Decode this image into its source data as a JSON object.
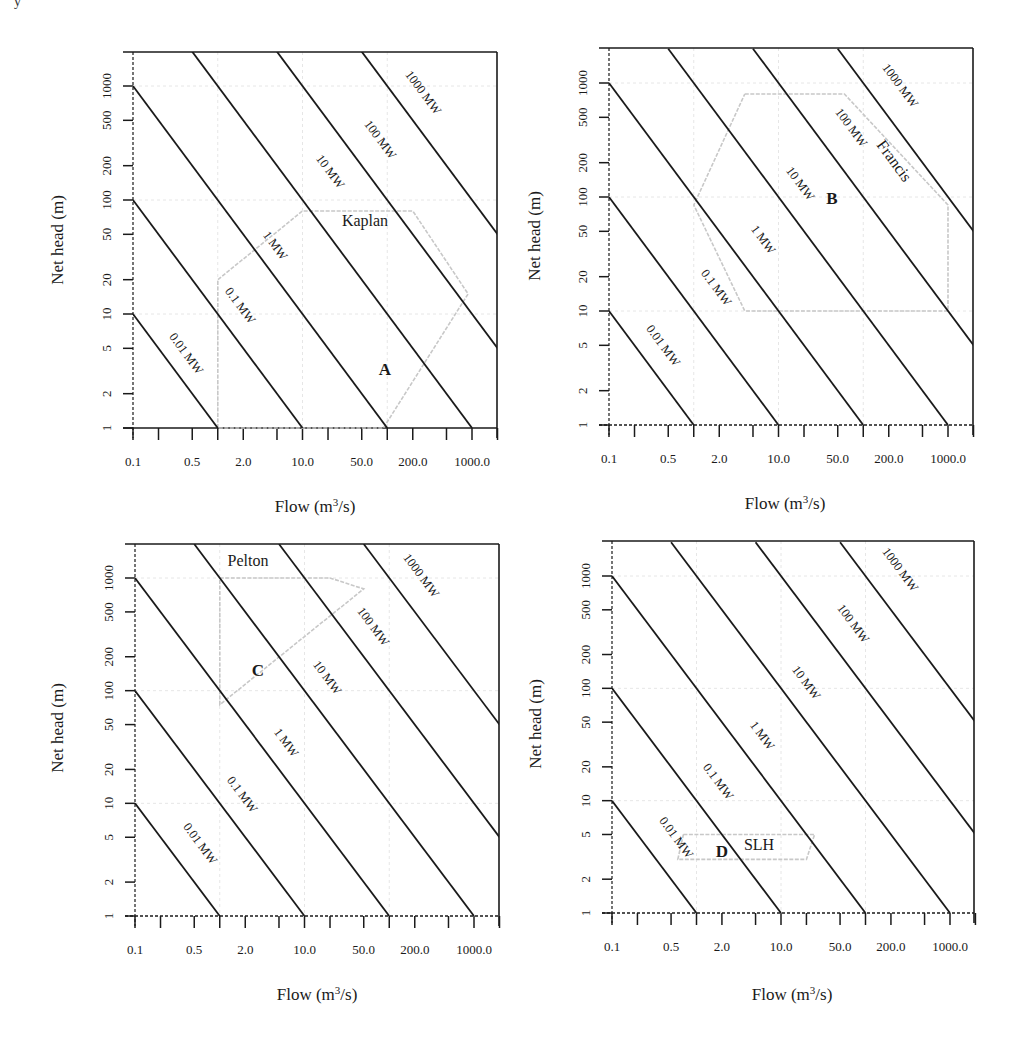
{
  "figure": {
    "corner_mark": "y",
    "shared": {
      "x_axis_title": "Flow (m³/s)",
      "y_axis_title": "Net head (m)",
      "x_tick_labels": [
        "0.1",
        "0.5",
        "2.0",
        "10.0",
        "50.0",
        "200.0",
        "1000.0"
      ],
      "y_tick_labels": [
        "1",
        "2",
        "5",
        "10",
        "20",
        "50",
        "100",
        "200",
        "500",
        "1000"
      ],
      "power_lines": [
        "0.01 MW",
        "0.1 MW",
        "1 MW",
        "10 MW",
        "100 MW",
        "1000 MW"
      ],
      "colors": {
        "line": "#1a1a1a",
        "region": "#c8c8c8",
        "grid": "#e6e6e6"
      }
    }
  },
  "chart_data": [
    {
      "type": "line",
      "panel": "A",
      "title": "",
      "region_name": "Kaplan",
      "region_letter": "A",
      "xlabel": "Flow (m³/s)",
      "ylabel": "Net head (m)",
      "xscale": "log",
      "yscale": "log",
      "xlim": [
        0.1,
        2000
      ],
      "ylim": [
        1,
        2000
      ],
      "x_ticks": [
        0.1,
        0.2,
        0.5,
        1,
        2,
        5,
        10,
        20,
        50,
        100,
        200,
        500,
        1000,
        2000
      ],
      "x_tick_labels": [
        "0.1",
        "0.5",
        "2.0",
        "10.0",
        "50.0",
        "200.0",
        "1000.0"
      ],
      "y_ticks": [
        1,
        2,
        5,
        10,
        20,
        50,
        100,
        200,
        500,
        1000
      ],
      "series": [
        {
          "name": "0.01 MW",
          "x": [
            0.1,
            1
          ],
          "y": [
            10,
            1
          ]
        },
        {
          "name": "0.1 MW",
          "x": [
            0.1,
            10
          ],
          "y": [
            100,
            1
          ]
        },
        {
          "name": "1 MW",
          "x": [
            0.1,
            100
          ],
          "y": [
            1000,
            1
          ]
        },
        {
          "name": "10 MW",
          "x": [
            0.5,
            1000
          ],
          "y": [
            2000,
            1
          ]
        },
        {
          "name": "100 MW",
          "x": [
            5,
            2000
          ],
          "y": [
            2000,
            5
          ]
        },
        {
          "name": "1000 MW",
          "x": [
            50,
            2000
          ],
          "y": [
            2000,
            50
          ]
        }
      ],
      "region_polygon": {
        "x": [
          1,
          1,
          10,
          200,
          900,
          90,
          1
        ],
        "y": [
          1,
          20,
          80,
          80,
          15,
          1,
          1
        ]
      },
      "px": {
        "x0": 133,
        "x1000": 472,
        "right": 497,
        "y1": 428,
        "y1000": 86,
        "top": 52
      },
      "labels_pos": {
        "name": [
          365,
          226
        ],
        "letter": [
          385,
          375
        ],
        "mw": [
          [
            183,
            356
          ],
          [
            237,
            308
          ],
          [
            272,
            248
          ],
          [
            327,
            174
          ],
          [
            377,
            142
          ],
          [
            420,
            95
          ]
        ]
      },
      "axis_title_pos": {
        "x": [
          315,
          512
        ],
        "y": [
          63,
          240
        ]
      }
    },
    {
      "type": "line",
      "panel": "B",
      "title": "",
      "region_name": "Francis",
      "region_letter": "B",
      "xlabel": "Flow (m³/s)",
      "ylabel": "Net head (m)",
      "xscale": "log",
      "yscale": "log",
      "xlim": [
        0.1,
        2000
      ],
      "ylim": [
        1,
        2000
      ],
      "x_ticks": [
        0.1,
        0.2,
        0.5,
        1,
        2,
        5,
        10,
        20,
        50,
        100,
        200,
        500,
        1000,
        2000
      ],
      "x_tick_labels": [
        "0.1",
        "0.5",
        "2.0",
        "10.0",
        "50.0",
        "200.0",
        "1000.0"
      ],
      "y_ticks": [
        1,
        2,
        5,
        10,
        20,
        50,
        100,
        200,
        500,
        1000
      ],
      "series": [
        {
          "name": "0.01 MW",
          "x": [
            0.1,
            1
          ],
          "y": [
            10,
            1
          ]
        },
        {
          "name": "0.1 MW",
          "x": [
            0.1,
            10
          ],
          "y": [
            100,
            1
          ]
        },
        {
          "name": "1 MW",
          "x": [
            0.1,
            100
          ],
          "y": [
            1000,
            1
          ]
        },
        {
          "name": "10 MW",
          "x": [
            0.5,
            1000
          ],
          "y": [
            2000,
            1
          ]
        },
        {
          "name": "100 MW",
          "x": [
            5,
            2000
          ],
          "y": [
            2000,
            5
          ]
        },
        {
          "name": "1000 MW",
          "x": [
            50,
            2000
          ],
          "y": [
            2000,
            50
          ]
        }
      ],
      "region_polygon": {
        "x": [
          4,
          60,
          1000,
          1000,
          4,
          1,
          4
        ],
        "y": [
          800,
          800,
          85,
          10,
          10,
          85,
          800
        ]
      },
      "px": {
        "x0": 609,
        "x1000": 948,
        "right": 973,
        "y1": 425,
        "y1000": 83,
        "top": 48
      },
      "labels_pos": {
        "name": [
          890,
          164
        ],
        "letter": [
          832,
          204
        ],
        "mw": [
          [
            660,
            348
          ],
          [
            713,
            290
          ],
          [
            760,
            242
          ],
          [
            797,
            186
          ],
          [
            848,
            130
          ],
          [
            897,
            88
          ]
        ]
      },
      "axis_title_pos": {
        "x": [
          785,
          509
        ],
        "y": [
          540,
          236
        ]
      }
    },
    {
      "type": "line",
      "panel": "C",
      "title": "",
      "region_name": "Pelton",
      "region_letter": "C",
      "xlabel": "Flow (m³/s)",
      "ylabel": "Net head (m)",
      "xscale": "log",
      "yscale": "log",
      "xlim": [
        0.1,
        2000
      ],
      "ylim": [
        1,
        2000
      ],
      "x_ticks": [
        0.1,
        0.2,
        0.5,
        1,
        2,
        5,
        10,
        20,
        50,
        100,
        200,
        500,
        1000,
        2000
      ],
      "x_tick_labels": [
        "0.1",
        "0.5",
        "2.0",
        "10.0",
        "50.0",
        "200.0",
        "1000.0"
      ],
      "y_ticks": [
        1,
        2,
        5,
        10,
        20,
        50,
        100,
        200,
        500,
        1000
      ],
      "series": [
        {
          "name": "0.01 MW",
          "x": [
            0.1,
            1
          ],
          "y": [
            10,
            1
          ]
        },
        {
          "name": "0.1 MW",
          "x": [
            0.1,
            10
          ],
          "y": [
            100,
            1
          ]
        },
        {
          "name": "1 MW",
          "x": [
            0.1,
            100
          ],
          "y": [
            1000,
            1
          ]
        },
        {
          "name": "10 MW",
          "x": [
            0.5,
            1000
          ],
          "y": [
            2000,
            1
          ]
        },
        {
          "name": "100 MW",
          "x": [
            5,
            2000
          ],
          "y": [
            2000,
            5
          ]
        },
        {
          "name": "1000 MW",
          "x": [
            50,
            2000
          ],
          "y": [
            2000,
            50
          ]
        }
      ],
      "region_polygon": {
        "x": [
          1,
          20,
          50,
          1,
          1
        ],
        "y": [
          1000,
          1000,
          800,
          75,
          1000
        ]
      },
      "px": {
        "x0": 135,
        "x1000": 474,
        "right": 499,
        "y1": 916,
        "y1000": 578,
        "top": 544
      },
      "labels_pos": {
        "name": [
          248,
          566
        ],
        "letter": [
          258,
          676
        ],
        "mw": [
          [
            197,
            846
          ],
          [
            239,
            797
          ],
          [
            283,
            745
          ],
          [
            324,
            680
          ],
          [
            370,
            629
          ],
          [
            418,
            578
          ]
        ]
      },
      "axis_title_pos": {
        "x": [
          317,
          1000
        ],
        "y": [
          63,
          728
        ]
      }
    },
    {
      "type": "line",
      "panel": "D",
      "title": "",
      "region_name": "SLH",
      "region_letter": "D",
      "xlabel": "Flow (m³/s)",
      "ylabel": "Net head (m)",
      "xscale": "log",
      "yscale": "log",
      "xlim": [
        0.1,
        2000
      ],
      "ylim": [
        1,
        2000
      ],
      "x_ticks": [
        0.1,
        0.2,
        0.5,
        1,
        2,
        5,
        10,
        20,
        50,
        100,
        200,
        500,
        1000,
        2000
      ],
      "x_tick_labels": [
        "0.1",
        "0.5",
        "2.0",
        "10.0",
        "50.0",
        "200.0",
        "1000.0"
      ],
      "y_ticks": [
        1,
        2,
        5,
        10,
        20,
        50,
        100,
        200,
        500,
        1000
      ],
      "series": [
        {
          "name": "0.01 MW",
          "x": [
            0.1,
            1
          ],
          "y": [
            10,
            1
          ]
        },
        {
          "name": "0.1 MW",
          "x": [
            0.1,
            10
          ],
          "y": [
            100,
            1
          ]
        },
        {
          "name": "1 MW",
          "x": [
            0.1,
            100
          ],
          "y": [
            1000,
            1
          ]
        },
        {
          "name": "10 MW",
          "x": [
            0.5,
            1000
          ],
          "y": [
            2000,
            1
          ]
        },
        {
          "name": "100 MW",
          "x": [
            5,
            2000
          ],
          "y": [
            2000,
            5
          ]
        },
        {
          "name": "1000 MW",
          "x": [
            50,
            2000
          ],
          "y": [
            2000,
            50
          ]
        }
      ],
      "region_polygon": {
        "x": [
          0.7,
          25,
          20,
          0.6,
          0.7
        ],
        "y": [
          5,
          5,
          3,
          3,
          5
        ]
      },
      "px": {
        "x0": 612,
        "x1000": 950,
        "right": 974,
        "y1": 913,
        "y1000": 576,
        "top": 541
      },
      "labels_pos": {
        "name": [
          759,
          850
        ],
        "letter": [
          722,
          857
        ],
        "mw": [
          [
            673,
            840
          ],
          [
            715,
            784
          ],
          [
            759,
            738
          ],
          [
            803,
            685
          ],
          [
            850,
            626
          ],
          [
            897,
            572
          ]
        ]
      },
      "axis_title_pos": {
        "x": [
          792,
          1000
        ],
        "y": [
          541,
          724
        ]
      }
    }
  ]
}
